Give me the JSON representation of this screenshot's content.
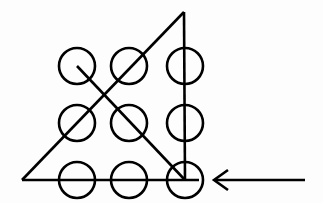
{
  "figure": {
    "name": "nine-dots-puzzle-solution",
    "background_color": "#fdfdfd",
    "stroke_color": "#000000",
    "stroke_width": 2.6,
    "width": 323,
    "height": 203
  },
  "grid": {
    "rows": 3,
    "columns": 3,
    "circle_radius": 18,
    "column_centers_x": [
      77,
      129,
      185
    ],
    "row_centers_y": [
      66,
      123,
      180
    ],
    "dots": [
      {
        "id": "dot-r1c1",
        "label": "row 1 column 1",
        "cx": 77,
        "cy": 66,
        "r": 18
      },
      {
        "id": "dot-r1c2",
        "label": "row 1 column 2",
        "cx": 129,
        "cy": 66,
        "r": 18
      },
      {
        "id": "dot-r1c3",
        "label": "row 1 column 3",
        "cx": 185,
        "cy": 66,
        "r": 18
      },
      {
        "id": "dot-r2c1",
        "label": "row 2 column 1",
        "cx": 77,
        "cy": 123,
        "r": 18
      },
      {
        "id": "dot-r2c2",
        "label": "row 2 column 2",
        "cx": 129,
        "cy": 123,
        "r": 18
      },
      {
        "id": "dot-r2c3",
        "label": "row 2 column 3",
        "cx": 185,
        "cy": 123,
        "r": 18
      },
      {
        "id": "dot-r3c1",
        "label": "row 3 column 1",
        "cx": 77,
        "cy": 180,
        "r": 18
      },
      {
        "id": "dot-r3c2",
        "label": "row 3 column 2",
        "cx": 129,
        "cy": 180,
        "r": 18
      },
      {
        "id": "dot-r3c3",
        "label": "row 3 column 3",
        "cx": 185,
        "cy": 180,
        "r": 18
      }
    ]
  },
  "lines": [
    {
      "id": "line-bottom-horizontal",
      "label": "bottom horizontal stroke through row 3",
      "x1": 22,
      "y1": 180,
      "x2": 199,
      "y2": 180
    },
    {
      "id": "line-left-diagonal",
      "label": "rising diagonal from bottom-left vertex to apex",
      "x1": 22,
      "y1": 180,
      "x2": 184,
      "y2": 12
    },
    {
      "id": "line-right-vertical",
      "label": "vertical stroke from apex down through column 3",
      "x1": 184,
      "y1": 12,
      "x2": 185,
      "y2": 181
    },
    {
      "id": "line-cross-diagonal",
      "label": "descending diagonal from top-left dot to bottom-right dot",
      "x1": 77,
      "y1": 66,
      "x2": 185,
      "y2": 180
    }
  ],
  "pointer": {
    "id": "pointer-arrow",
    "label": "left-pointing arrow indicating start point",
    "direction": "left",
    "tip_x": 214,
    "tip_y": 180,
    "tail_x": 305,
    "tail_y": 180,
    "head_upper_x": 228,
    "head_upper_y": 170,
    "head_lower_x": 228,
    "head_lower_y": 190
  },
  "accessibility": {
    "description": "A three by three grid of nine open circles. Four straight strokes pass through the circles forming a triangle-like path: a horizontal line along the bottom row, a diagonal rising from the lower left to an apex above the third column, a vertical line descending from that apex through the third column, and a diagonal crossing from the top-left circle down to the bottom-right circle. A horizontal arrow at the right points left toward the bottom-right circle."
  }
}
